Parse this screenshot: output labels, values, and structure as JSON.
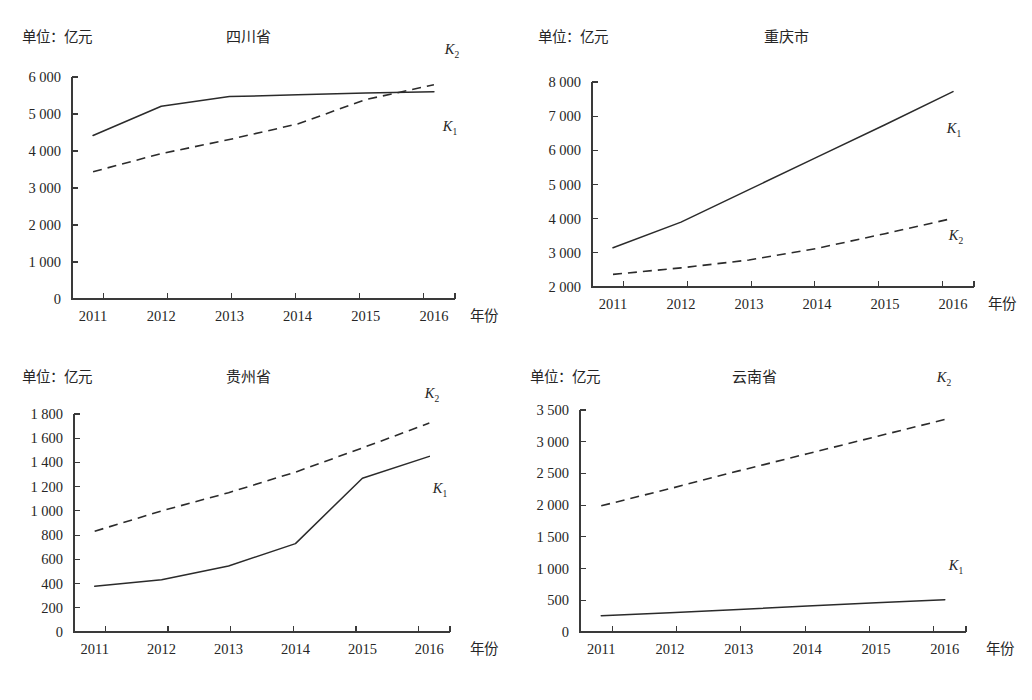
{
  "figure": {
    "background_color": "#ffffff",
    "line_color": "#2b2b2b",
    "axis_color": "#3a3a3a",
    "panel_count": 4
  },
  "common": {
    "unit_label": "单位：亿元",
    "x_axis_title": "年份",
    "categories": [
      "2011",
      "2012",
      "2013",
      "2014",
      "2015",
      "2016"
    ],
    "legend": {
      "k1_base": "K",
      "k1_sub": "1",
      "k2_base": "K",
      "k2_sub": "2"
    }
  },
  "chart_data": [
    {
      "id": "sichuan",
      "type": "line",
      "title": "四川省",
      "xlabel": "年份",
      "ylabel": "单位：亿元",
      "categories": [
        "2011",
        "2012",
        "2013",
        "2014",
        "2015",
        "2016"
      ],
      "ylim": [
        0,
        6000
      ],
      "yticks": [
        0,
        1000,
        2000,
        3000,
        4000,
        5000,
        6000
      ],
      "ytick_labels": [
        "0",
        "1 000",
        "2 000",
        "3 000",
        "4 000",
        "5 000",
        "6 000"
      ],
      "grid": false,
      "legend_position": "inside-right",
      "series": [
        {
          "name": "K1",
          "style": "solid",
          "label_text": "K",
          "label_sub": "1",
          "values": [
            4420,
            5210,
            5470,
            5520,
            5570,
            5600
          ]
        },
        {
          "name": "K2",
          "style": "dashed",
          "label_text": "K",
          "label_sub": "2",
          "values": [
            3440,
            3930,
            4310,
            4730,
            5390,
            5790
          ]
        }
      ]
    },
    {
      "id": "chongqing",
      "type": "line",
      "title": "重庆市",
      "xlabel": "年份",
      "ylabel": "单位：亿元",
      "categories": [
        "2011",
        "2012",
        "2013",
        "2014",
        "2015",
        "2016"
      ],
      "ylim": [
        2000,
        8000
      ],
      "yticks": [
        2000,
        3000,
        4000,
        5000,
        6000,
        7000,
        8000
      ],
      "ytick_labels": [
        "2 000",
        "3 000",
        "4 000",
        "5 000",
        "6 000",
        "7 000",
        "8 000"
      ],
      "grid": false,
      "legend_position": "inside-right",
      "series": [
        {
          "name": "K1",
          "style": "solid",
          "label_text": "K",
          "label_sub": "1",
          "values": [
            3150,
            3900,
            4850,
            5800,
            6750,
            7720
          ]
        },
        {
          "name": "K2",
          "style": "dashed",
          "label_text": "K",
          "label_sub": "2",
          "values": [
            2370,
            2560,
            2790,
            3130,
            3560,
            4010
          ]
        }
      ]
    },
    {
      "id": "guizhou",
      "type": "line",
      "title": "贵州省",
      "xlabel": "年份",
      "ylabel": "单位：亿元",
      "categories": [
        "2011",
        "2012",
        "2013",
        "2014",
        "2015",
        "2016"
      ],
      "ylim": [
        0,
        1800
      ],
      "yticks": [
        0,
        200,
        400,
        600,
        800,
        1000,
        1200,
        1400,
        1600,
        1800
      ],
      "ytick_labels": [
        "0",
        "200",
        "400",
        "600",
        "800",
        "1 000",
        "1 200",
        "1 400",
        "1 600",
        "1 800"
      ],
      "grid": false,
      "legend_position": "inside-right",
      "series": [
        {
          "name": "K1",
          "style": "solid",
          "label_text": "K",
          "label_sub": "1",
          "values": [
            378,
            432,
            545,
            730,
            1270,
            1450
          ]
        },
        {
          "name": "K2",
          "style": "dashed",
          "label_text": "K",
          "label_sub": "2",
          "values": [
            832,
            1000,
            1150,
            1320,
            1520,
            1725
          ]
        }
      ]
    },
    {
      "id": "yunnan",
      "type": "line",
      "title": "云南省",
      "xlabel": "年份",
      "ylabel": "单位：亿元",
      "categories": [
        "2011",
        "2012",
        "2013",
        "2014",
        "2015",
        "2016"
      ],
      "ylim": [
        0,
        3500
      ],
      "yticks": [
        0,
        500,
        1000,
        1500,
        2000,
        2500,
        3000,
        3500
      ],
      "ytick_labels": [
        "0",
        "500",
        "1 000",
        "1 500",
        "2 000",
        "2 500",
        "3 000",
        "3 500"
      ],
      "grid": false,
      "legend_position": "inside-right",
      "series": [
        {
          "name": "K1",
          "style": "solid",
          "label_text": "K",
          "label_sub": "1",
          "values": [
            255,
            305,
            355,
            410,
            460,
            510
          ]
        },
        {
          "name": "K2",
          "style": "dashed",
          "label_text": "K",
          "label_sub": "2",
          "values": [
            1990,
            2260,
            2540,
            2810,
            3080,
            3350
          ]
        }
      ]
    }
  ],
  "panels": {
    "sichuan": {
      "title": "四川省",
      "unit_label": "单位：亿元",
      "x_axis_title": "年份"
    },
    "chongqing": {
      "title": "重庆市",
      "unit_label": "单位：亿元",
      "x_axis_title": "年份"
    },
    "guizhou": {
      "title": "贵州省",
      "unit_label": "单位：亿元",
      "x_axis_title": "年份"
    },
    "yunnan": {
      "title": "云南省",
      "unit_label": "单位：亿元",
      "x_axis_title": "年份"
    }
  }
}
